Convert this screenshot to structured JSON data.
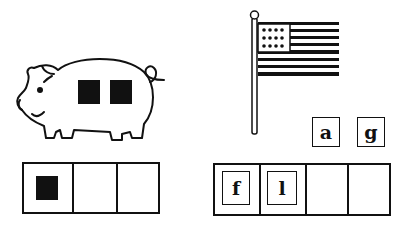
{
  "activity": {
    "type": "sound-boxes",
    "colors": {
      "ink": "#111111",
      "background": "#ffffff"
    }
  },
  "left_panel": {
    "picture": "pig",
    "counters_on_picture": 2,
    "boxes": 3,
    "filled_boxes": [
      {
        "index": 0,
        "content": "counter"
      }
    ]
  },
  "right_panel": {
    "picture": "american-flag",
    "boxes": 4,
    "letters_in_boxes": [
      "f",
      "l"
    ],
    "loose_tiles": [
      "a",
      "g"
    ]
  }
}
